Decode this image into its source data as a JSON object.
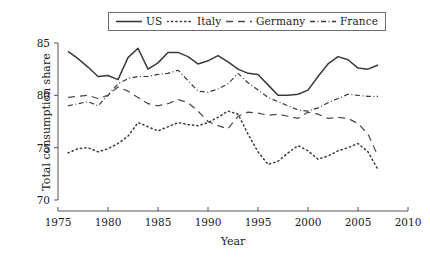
{
  "chart_data": {
    "type": "line",
    "title": "",
    "xlabel": "Year",
    "ylabel": "Total consumption share",
    "xlim": [
      1975,
      2010
    ],
    "ylim": [
      70,
      85
    ],
    "xticks": [
      1975,
      1980,
      1985,
      1990,
      1995,
      2000,
      2005,
      2010
    ],
    "yticks": [
      70,
      75,
      80,
      85
    ],
    "grid": false,
    "legend_position": "top-center",
    "x": [
      1976,
      1977,
      1978,
      1979,
      1980,
      1981,
      1982,
      1983,
      1984,
      1985,
      1986,
      1987,
      1988,
      1989,
      1990,
      1991,
      1992,
      1993,
      1994,
      1995,
      1996,
      1997,
      1998,
      1999,
      2000,
      2001,
      2002,
      2003,
      2004,
      2005,
      2006,
      2007
    ],
    "series": [
      {
        "name": "US",
        "style": "solid",
        "color": "#3a3a3a",
        "values": [
          84.2,
          83.5,
          82.7,
          81.8,
          81.9,
          81.5,
          83.6,
          84.5,
          82.5,
          83.1,
          84.1,
          84.1,
          83.7,
          83.0,
          83.3,
          83.8,
          83.2,
          82.5,
          82.1,
          82.0,
          81.0,
          80.0,
          80.0,
          80.1,
          80.5,
          81.8,
          83.0,
          83.7,
          83.4,
          82.6,
          82.5,
          82.9
        ]
      },
      {
        "name": "Italy",
        "style": "dotted",
        "color": "#3a3a3a",
        "values": [
          74.5,
          74.9,
          75.0,
          74.6,
          74.9,
          75.4,
          76.1,
          77.4,
          77.0,
          76.6,
          77.0,
          77.4,
          77.2,
          77.1,
          77.4,
          77.9,
          78.5,
          78.2,
          76.3,
          74.6,
          73.4,
          73.7,
          74.5,
          75.2,
          74.7,
          73.9,
          74.2,
          74.7,
          75.0,
          75.4,
          74.6,
          72.9
        ]
      },
      {
        "name": "Germany",
        "style": "dashed",
        "color": "#4a4a4a",
        "values": [
          79.8,
          79.9,
          80.0,
          79.7,
          80.0,
          80.8,
          80.4,
          79.8,
          79.2,
          79.0,
          79.2,
          79.6,
          79.3,
          78.5,
          77.5,
          77.1,
          76.8,
          78.0,
          78.4,
          78.3,
          78.1,
          78.2,
          78.0,
          77.8,
          78.4,
          78.2,
          77.8,
          77.9,
          77.8,
          77.3,
          76.3,
          74.2
        ]
      },
      {
        "name": "France",
        "style": "dashdot",
        "color": "#3a3a3a",
        "values": [
          79.0,
          79.2,
          79.4,
          79.0,
          80.0,
          81.1,
          81.6,
          81.8,
          81.8,
          82.0,
          82.1,
          82.4,
          81.4,
          80.4,
          80.3,
          80.6,
          81.1,
          82.1,
          81.2,
          80.5,
          79.8,
          79.4,
          79.0,
          78.6,
          78.5,
          78.8,
          79.3,
          79.7,
          80.1,
          80.0,
          79.9,
          79.9
        ]
      }
    ]
  },
  "legend": {
    "entries": [
      {
        "label": "US",
        "icon": "solid-line-icon"
      },
      {
        "label": "Italy",
        "icon": "dotted-line-icon"
      },
      {
        "label": "Germany",
        "icon": "dashed-line-icon"
      },
      {
        "label": "France",
        "icon": "dashdot-line-icon"
      }
    ]
  },
  "axes": {
    "y_title": "Total consumption share",
    "x_title": "Year",
    "y_ticks": [
      "85",
      "80",
      "75",
      "70"
    ],
    "x_ticks": [
      "1975",
      "1980",
      "1985",
      "1990",
      "1995",
      "2000",
      "2005",
      "2010"
    ]
  }
}
